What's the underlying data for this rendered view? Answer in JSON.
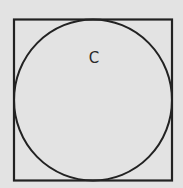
{
  "diagram": {
    "type": "inscribed-circle-in-square",
    "label": "C",
    "colors": {
      "background": "#e3e3e3",
      "stroke": "#222222",
      "label": "#2a2a2a"
    },
    "square": {
      "x": 14,
      "y": 19.5,
      "width": 158,
      "height": 161
    },
    "circle": {
      "cx": 93,
      "cy": 100,
      "rx": 79,
      "ry": 80.5
    }
  }
}
